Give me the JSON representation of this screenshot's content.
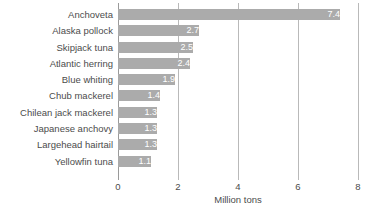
{
  "chart_data": {
    "type": "bar",
    "orientation": "horizontal",
    "title": "",
    "xlabel": "Million tons",
    "ylabel": "",
    "xlim": [
      0,
      8
    ],
    "xticks": [
      "0",
      "2",
      "4",
      "6",
      "8"
    ],
    "xtick_values": [
      0,
      2,
      4,
      6,
      8
    ],
    "grid": "vertical",
    "legend": "none",
    "bar_color": "#ababab",
    "value_label_color": "#ffffff",
    "text_color": "#4c4c4c",
    "categories": [
      "Anchoveta",
      "Alaska pollock",
      "Skipjack tuna",
      "Atlantic herring",
      "Blue whiting",
      "Chub mackerel",
      "Chilean jack mackerel",
      "Japanese anchovy",
      "Largehead hairtail",
      "Yellowfin tuna"
    ],
    "values": [
      7.4,
      2.7,
      2.5,
      2.4,
      1.9,
      1.4,
      1.3,
      1.3,
      1.3,
      1.1
    ],
    "value_labels": [
      "7.4",
      "2.7",
      "2.5",
      "2.4",
      "1.9",
      "1.4",
      "1.3",
      "1.3",
      "1.3",
      "1.1"
    ]
  }
}
